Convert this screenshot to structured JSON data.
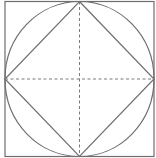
{
  "diagram": {
    "title": "",
    "colors": {
      "background": "#ffffff",
      "stroke": "#6e6e6e",
      "dashed": "#7a7a7a"
    },
    "square": {
      "x": 5,
      "y": 1.5,
      "width": 149,
      "height": 155
    },
    "circle": {
      "cx": 79.5,
      "cy": 79,
      "rx": 74.5,
      "ry": 77.5
    },
    "diamond": {
      "points": "79.5,1.5 154,79 79.5,156.5 5,79"
    },
    "center_lines": {
      "vertical": {
        "x1": 79.5,
        "y1": 1.5,
        "x2": 79.5,
        "y2": 156.5
      },
      "horizontal": {
        "x1": 5,
        "y1": 79,
        "x2": 154,
        "y2": 79
      },
      "style": "dashed"
    }
  }
}
